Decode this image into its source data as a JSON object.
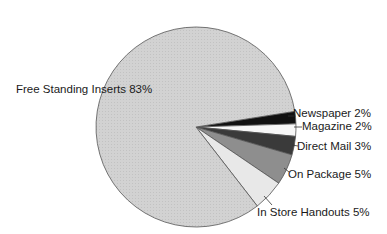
{
  "chart_data": {
    "type": "pie",
    "title": "",
    "start_angle_deg": -9,
    "direction": "clockwise",
    "center": [
      196,
      127
    ],
    "radius": 100,
    "slices": [
      {
        "label": "Newspaper",
        "value": 2,
        "display": "2%",
        "color": "#111111"
      },
      {
        "label": "Magazine",
        "value": 2,
        "display": "2%",
        "color": "#f7f7f7"
      },
      {
        "label": "Direct Mail",
        "value": 3,
        "display": "3%",
        "color": "#3a3a3a"
      },
      {
        "label": "On Package",
        "value": 5,
        "display": "5%",
        "color": "#8e8e8e"
      },
      {
        "label": "In Store Handouts",
        "value": 5,
        "display": "5%",
        "color": "#e8e8e8"
      },
      {
        "label": "Free Standing Inserts",
        "value": 83,
        "display": "83%",
        "color": "#d3d3d3"
      }
    ],
    "labels": [
      {
        "text": "Newspaper  2%",
        "x": 293,
        "y": 117,
        "anchor": "start",
        "leader": [
          [
            288,
            116
          ],
          [
            294,
            116
          ]
        ]
      },
      {
        "text": "Magazine  2%",
        "x": 302,
        "y": 130,
        "anchor": "start",
        "leader": [
          [
            294,
            127
          ],
          [
            302,
            127
          ]
        ]
      },
      {
        "text": "Direct Mail  3%",
        "x": 297,
        "y": 150,
        "anchor": "start",
        "leader": [
          [
            292,
            145
          ],
          [
            298,
            146
          ]
        ]
      },
      {
        "text": "On Package  5%",
        "x": 288,
        "y": 178,
        "anchor": "start",
        "leader": [
          [
            284,
            168
          ],
          [
            289,
            172
          ]
        ]
      },
      {
        "text": "In Store Handouts  5%",
        "x": 257,
        "y": 216,
        "anchor": "start",
        "leader": [
          [
            264,
            196
          ],
          [
            272,
            205
          ]
        ]
      },
      {
        "text": "Free Standing Inserts  83%",
        "x": 16,
        "y": 93,
        "anchor": "start",
        "leader": []
      }
    ],
    "legend": null
  }
}
